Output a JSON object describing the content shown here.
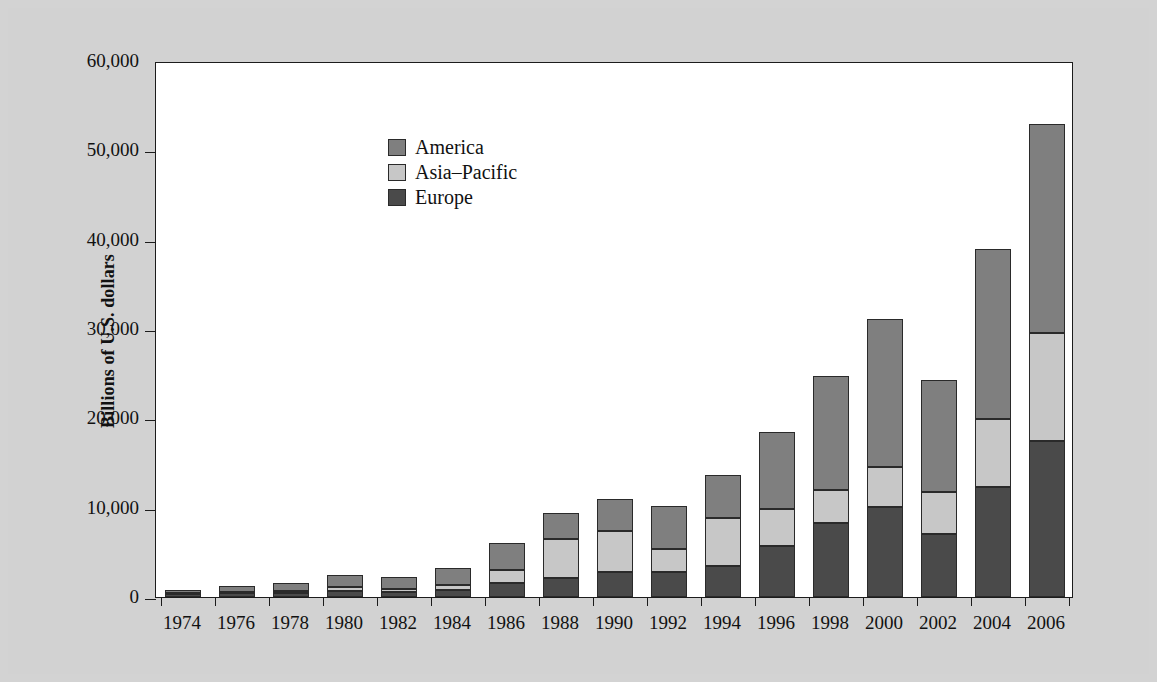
{
  "chart_data": {
    "type": "bar",
    "subtype": "stacked-bar",
    "title": "",
    "xlabel": "",
    "ylabel": "Billions of U.S. dollars",
    "ylim": [
      0,
      60000
    ],
    "ytick_values": [
      0,
      10000,
      20000,
      30000,
      40000,
      50000,
      60000
    ],
    "ytick_labels": [
      "0",
      "10,000",
      "20,000",
      "30,000",
      "40,000",
      "50,000",
      "60,000"
    ],
    "grid": false,
    "legend_position": "top-left-inside",
    "categories": [
      "1974",
      "1976",
      "1978",
      "1980",
      "1982",
      "1984",
      "1986",
      "1988",
      "1990",
      "1992",
      "1994",
      "1996",
      "1998",
      "2000",
      "2002",
      "2004",
      "2006"
    ],
    "series": [
      {
        "name": "Europe",
        "color": "#4a4a4a",
        "values": [
          300,
          400,
          500,
          700,
          600,
          800,
          1600,
          2100,
          2800,
          2800,
          3500,
          5700,
          8300,
          10100,
          7000,
          12300,
          17500
        ]
      },
      {
        "name": "Asia-Pacific",
        "color": "#c7c7c7",
        "values": [
          100,
          200,
          200,
          400,
          300,
          500,
          1400,
          4400,
          4600,
          2600,
          5300,
          4100,
          3700,
          4500,
          4700,
          7600,
          12000
        ]
      },
      {
        "name": "America",
        "color": "#7f7f7f",
        "values": [
          400,
          600,
          900,
          1400,
          1300,
          1900,
          3000,
          2900,
          3600,
          4800,
          4900,
          8700,
          12700,
          16500,
          12600,
          19100,
          23500
        ]
      }
    ],
    "totals": [
      800,
      1200,
      1600,
      2500,
      2200,
      3200,
      6000,
      9400,
      11000,
      10200,
      13700,
      18500,
      24700,
      31100,
      24300,
      39000,
      53000
    ]
  },
  "legend": {
    "entries": [
      {
        "label": "America",
        "color": "#7f7f7f"
      },
      {
        "label": "Asia–Pacific",
        "color": "#c7c7c7"
      },
      {
        "label": "Europe",
        "color": "#4a4a4a"
      }
    ]
  },
  "axis": {
    "y_title": "Billions of U.S. dollars"
  }
}
